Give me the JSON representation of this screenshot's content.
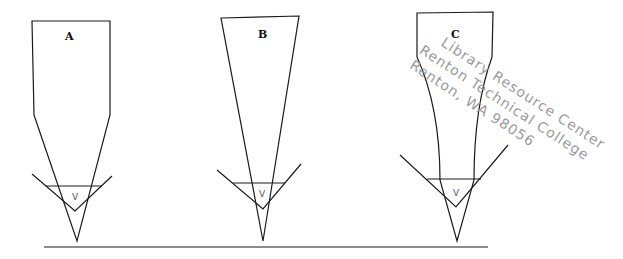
{
  "figure": {
    "panels": [
      {
        "id": "A",
        "label": "A",
        "v_label": "V",
        "shape": "rectangle-with-tapered-point"
      },
      {
        "id": "B",
        "label": "B",
        "v_label": "V",
        "shape": "inverted-triangle"
      },
      {
        "id": "C",
        "label": "C",
        "v_label": "V",
        "shape": "rectangle-with-concave-taper"
      }
    ],
    "baseline": "ground-line"
  },
  "watermark": {
    "line1": "Library Resource Center",
    "line2": "Renton Technical College",
    "line3": "Renton, WA 98056"
  }
}
